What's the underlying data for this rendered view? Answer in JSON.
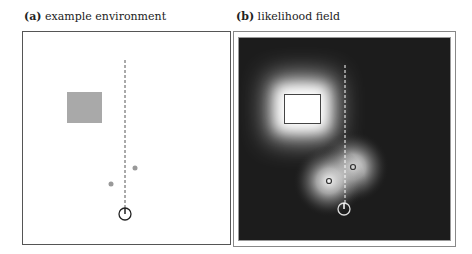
{
  "panels": [
    {
      "id": "a",
      "label": "(a)",
      "title": "example environment"
    },
    {
      "id": "b",
      "label": "(b)",
      "title": "likelihood field"
    }
  ],
  "colors": {
    "obstacle_fill": "#a9a9a9",
    "field_background": "#1c1c1c",
    "frame": "#555555"
  }
}
